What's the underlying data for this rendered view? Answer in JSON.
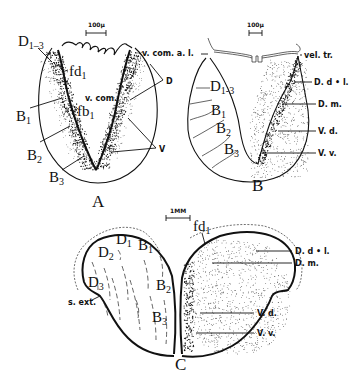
{
  "panels": {
    "A": {
      "letter": "A",
      "scale": "100µ",
      "labels": {
        "d13": "D",
        "d13_sub": "1–3",
        "fd1": "fd",
        "fd1_sub": "1",
        "b1": "B",
        "b1_sub": "1",
        "fb1": "fb",
        "fb1_sub": "1",
        "b2": "B",
        "b2_sub": "2",
        "b3": "B",
        "b3_sub": "3",
        "vcom": "v. com.",
        "d": "D",
        "v": "V"
      }
    },
    "B": {
      "letter": "B",
      "scale": "100µ",
      "labels": {
        "vcomal": "v. com. a. l.",
        "veltr": "vel. tr.",
        "d13": "D",
        "d13_sub": "1-3",
        "b1": "B",
        "b1_sub": "1",
        "b2": "B",
        "b2_sub": "2",
        "b3": "B",
        "b3_sub": "3",
        "ddl": "D. d • l.",
        "dm": "D. m.",
        "vd": "V. d.",
        "vv": "V. v."
      }
    },
    "C": {
      "letter": "C",
      "scale": "1MM",
      "labels": {
        "fd1": "fd",
        "fd1_sub": "1",
        "d1": "D",
        "d1_sub": "1",
        "d2": "D",
        "d2_sub": "2",
        "d3": "D",
        "d3_sub": "3",
        "b1": "B",
        "b1_sub": "1",
        "b2": "B",
        "b2_sub": "2",
        "b3": "B",
        "b3_sub": "3",
        "sext": "s. ext.",
        "ddl": "D. d • l.",
        "dm": "D. m.",
        "vd": "V. d.",
        "vv": "V. v."
      }
    }
  }
}
